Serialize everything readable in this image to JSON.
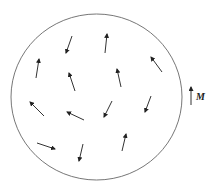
{
  "diagram": {
    "background": "#ffffff",
    "stroke_color": "#333333",
    "circle_color": "#777777",
    "circle": {
      "cx": 96.5,
      "cy": 97,
      "rx": 85.5,
      "ry": 83
    },
    "arrows": [
      {
        "x1": 72,
        "y1": 36,
        "x2": 66,
        "y2": 53
      },
      {
        "x1": 105,
        "y1": 53,
        "x2": 107,
        "y2": 34
      },
      {
        "x1": 36,
        "y1": 78,
        "x2": 39,
        "y2": 59
      },
      {
        "x1": 75,
        "y1": 91,
        "x2": 69,
        "y2": 73
      },
      {
        "x1": 121,
        "y1": 87,
        "x2": 117,
        "y2": 69
      },
      {
        "x1": 162,
        "y1": 72,
        "x2": 151,
        "y2": 57
      },
      {
        "x1": 44,
        "y1": 116,
        "x2": 30,
        "y2": 102
      },
      {
        "x1": 84,
        "y1": 120,
        "x2": 67,
        "y2": 112
      },
      {
        "x1": 112,
        "y1": 101,
        "x2": 104,
        "y2": 117
      },
      {
        "x1": 151,
        "y1": 96,
        "x2": 145,
        "y2": 112
      },
      {
        "x1": 37,
        "y1": 143,
        "x2": 55,
        "y2": 149
      },
      {
        "x1": 83,
        "y1": 144,
        "x2": 79,
        "y2": 161
      },
      {
        "x1": 122,
        "y1": 151,
        "x2": 126,
        "y2": 134
      }
    ],
    "legend": {
      "arrow": {
        "x1": 191,
        "y1": 105,
        "x2": 191,
        "y2": 87
      },
      "label": "M",
      "label_x": 196,
      "label_y": 92
    }
  }
}
